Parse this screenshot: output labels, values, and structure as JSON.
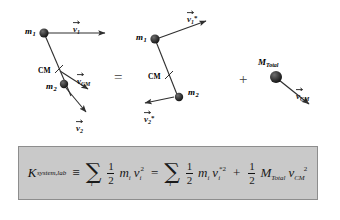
{
  "figure": {
    "background_color": "#ffffff",
    "ink_color": "#1a1a1a"
  },
  "diagram": {
    "operator_equals": "=",
    "operator_plus": "+",
    "panels": [
      {
        "id": "lab-frame",
        "name": "lab-frame-panel",
        "bodies": [
          {
            "name": "mass-1",
            "label_base": "m",
            "label_sub": "1"
          },
          {
            "name": "mass-2",
            "label_base": "m",
            "label_sub": "2"
          }
        ],
        "cm_label": "CM",
        "vectors": [
          {
            "name": "v1-vector",
            "base": "v",
            "sub": "1",
            "star": "",
            "direction": "right"
          },
          {
            "name": "vcm-vector",
            "base": "v",
            "sub": "CM",
            "star": "",
            "direction": "down-right"
          },
          {
            "name": "v2-vector",
            "base": "v",
            "sub": "2",
            "star": "",
            "direction": "down-right"
          }
        ]
      },
      {
        "id": "cm-frame",
        "name": "cm-frame-panel",
        "bodies": [
          {
            "name": "mass-1",
            "label_base": "m",
            "label_sub": "1"
          },
          {
            "name": "mass-2",
            "label_base": "m",
            "label_sub": "2"
          }
        ],
        "cm_label": "CM",
        "vectors": [
          {
            "name": "v1-star-vector",
            "base": "v",
            "sub": "1",
            "star": "*",
            "direction": "up-right"
          },
          {
            "name": "v2-star-vector",
            "base": "v",
            "sub": "2",
            "star": "*",
            "direction": "left"
          }
        ]
      },
      {
        "id": "cm-motion",
        "name": "cm-motion-panel",
        "bodies": [
          {
            "name": "total-mass",
            "label_base": "M",
            "label_sub": "Total"
          }
        ],
        "vectors": [
          {
            "name": "vcm-vector",
            "base": "v",
            "sub": "CM",
            "star": "",
            "direction": "down-right"
          }
        ]
      }
    ]
  },
  "equation": {
    "name": "kinetic-energy-equation",
    "panel_background": "#c9c9c9",
    "panel_border": "#8d8d8d",
    "plain_text": "K_system,lab = sum_i 1/2 m_i v_i^2 = sum_i 1/2 m_i v_i*^2 + 1/2 M_Total v_CM^2",
    "lhs": {
      "symbol": "K",
      "subscript": "system,lab"
    },
    "relation_identity": "≡",
    "relation_equals": "=",
    "plus": "+",
    "sum_glyph": "∑",
    "sum_index": "i",
    "half_numerator": "1",
    "half_denominator": "2",
    "term1": {
      "mass": "m",
      "mass_sub": "i",
      "vel": "v",
      "vel_sub": "i",
      "vel_star": "",
      "vel_pow": "2"
    },
    "term2": {
      "mass": "m",
      "mass_sub": "i",
      "vel": "v",
      "vel_sub": "i",
      "vel_star": "*",
      "vel_pow": "2"
    },
    "term3": {
      "mass": "M",
      "mass_sub": "Total",
      "vel": "v",
      "vel_sub": "CM",
      "vel_star": "",
      "vel_pow": "2"
    }
  }
}
